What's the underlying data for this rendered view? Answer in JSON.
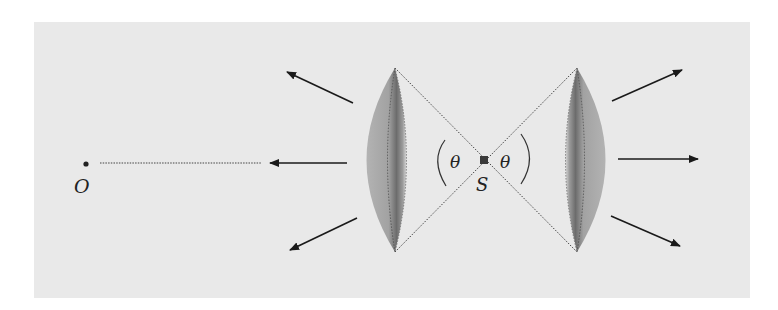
{
  "diagram": {
    "type": "physics-diagram",
    "labels": {
      "observer": "O",
      "source": "S",
      "angle_left": "θ",
      "angle_right": "θ"
    },
    "colors": {
      "background": "#ffffff",
      "panel": "#e9e9e9",
      "lens_fill": "#a9a9a9",
      "lens_dark": "#6e6e6e",
      "lines": "#333333",
      "arrows": "#1a1a1a"
    },
    "elements": {
      "left_cap": {
        "tip_top": [
          395,
          68
        ],
        "tip_bottom": [
          395,
          252
        ]
      },
      "right_cap": {
        "tip_top": [
          577,
          68
        ],
        "tip_bottom": [
          577,
          252
        ]
      },
      "source_point": [
        484,
        160
      ],
      "observer_point": [
        86,
        164
      ],
      "arrows_count": 6
    }
  }
}
